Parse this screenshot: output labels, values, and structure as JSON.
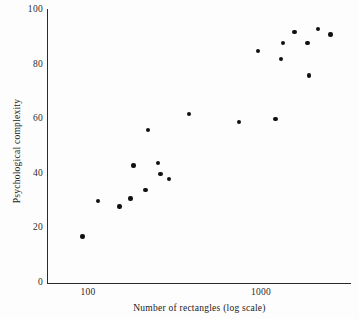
{
  "chart_data": {
    "type": "scatter",
    "title": "",
    "xlabel": "Number of rectangles (log scale)",
    "ylabel": "Psychological complexity",
    "xscale": "log",
    "yscale": "linear",
    "grid": false,
    "legend": null,
    "xticks": [
      100,
      1000
    ],
    "xtick_labels": [
      "100",
      "1000"
    ],
    "yticks": [
      0,
      20,
      40,
      60,
      80,
      100
    ],
    "ytick_labels": [
      "0",
      "20",
      "40",
      "60",
      "80",
      "100"
    ],
    "ylim": [
      0,
      100
    ],
    "xlim": [
      72,
      2800
    ],
    "marker": "filled-circle",
    "marker_color": "#111111",
    "points": [
      {
        "x": 93,
        "y": 17
      },
      {
        "x": 114,
        "y": 30
      },
      {
        "x": 152,
        "y": 28
      },
      {
        "x": 176,
        "y": 31
      },
      {
        "x": 183,
        "y": 43
      },
      {
        "x": 215,
        "y": 34
      },
      {
        "x": 222,
        "y": 56
      },
      {
        "x": 253,
        "y": 44
      },
      {
        "x": 262,
        "y": 40
      },
      {
        "x": 295,
        "y": 38
      },
      {
        "x": 383,
        "y": 62
      },
      {
        "x": 745,
        "y": 59
      },
      {
        "x": 960,
        "y": 85
      },
      {
        "x": 1215,
        "y": 60
      },
      {
        "x": 1310,
        "y": 82
      },
      {
        "x": 1340,
        "y": 88
      },
      {
        "x": 1560,
        "y": 92
      },
      {
        "x": 1860,
        "y": 88
      },
      {
        "x": 1900,
        "y": 76
      },
      {
        "x": 2130,
        "y": 93
      },
      {
        "x": 2520,
        "y": 91
      }
    ]
  },
  "figure": {
    "name": "psychological-complexity-scatter",
    "background": "#fdfdfd",
    "axis_color": "#2b2b2b"
  }
}
